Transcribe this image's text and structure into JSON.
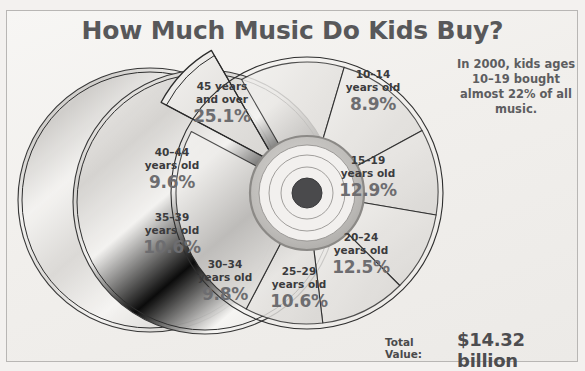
{
  "title": "How Much Music Do Kids Buy?",
  "annotation": "In 2000, kids ages 10–19 bought almost 22% of all music.",
  "total": {
    "label": "Total Value:",
    "value": "$14.32 billion"
  },
  "colors": {
    "background": "#f3f1ef",
    "frame_border": "#b8b6b4",
    "title_text": "#58585a",
    "label_text": "#3b3b3d",
    "percent_text": "#6d6d70",
    "slice_fill_light": "#f0eeec",
    "slice_fill_dark": "#d9d7d4",
    "slice_stroke": "#2b2b2b",
    "hub_dark": "#4a4a4c",
    "cd_outline": "#2e2e2e"
  },
  "chart_data": {
    "type": "pie",
    "title": "How Much Music Do Kids Buy?",
    "unit": "percent of all music purchased",
    "xlabel": "",
    "ylabel": "",
    "legend": "none (labels on slices)",
    "grid": false,
    "total_value": "$14.32 billion",
    "exploded_slice": "10–14 years old",
    "categories": [
      "10–14 years old",
      "15–19 years old",
      "20–24 years old",
      "25–29 years old",
      "30–34 years old",
      "35–39 years old",
      "40–44 years old",
      "45 years and over"
    ],
    "values": [
      8.9,
      12.9,
      12.5,
      10.6,
      9.8,
      10.6,
      9.6,
      25.1
    ],
    "slices": [
      {
        "id": "10-14",
        "name": "10–14",
        "sub": "years old",
        "percent": 8.9,
        "percent_label": "8.9%",
        "exploded": true,
        "label_x": 373,
        "label_y": 68
      },
      {
        "id": "15-19",
        "name": "15–19",
        "sub": "years old",
        "percent": 12.9,
        "percent_label": "12.9%",
        "exploded": false,
        "label_x": 368,
        "label_y": 154
      },
      {
        "id": "20-24",
        "name": "20–24",
        "sub": "years old",
        "percent": 12.5,
        "percent_label": "12.5%",
        "exploded": false,
        "label_x": 361,
        "label_y": 231
      },
      {
        "id": "25-29",
        "name": "25–29",
        "sub": "years old",
        "percent": 10.6,
        "percent_label": "10.6%",
        "exploded": false,
        "label_x": 299,
        "label_y": 265
      },
      {
        "id": "30-34",
        "name": "30–34",
        "sub": "years old",
        "percent": 9.8,
        "percent_label": "9.8%",
        "exploded": false,
        "label_x": 225,
        "label_y": 258
      },
      {
        "id": "35-39",
        "name": "35–39",
        "sub": "years old",
        "percent": 10.6,
        "percent_label": "10.6%",
        "exploded": false,
        "label_x": 172,
        "label_y": 211
      },
      {
        "id": "40-44",
        "name": "40–44",
        "sub": "years old",
        "percent": 9.6,
        "percent_label": "9.6%",
        "exploded": false,
        "label_x": 172,
        "label_y": 146
      },
      {
        "id": "45-over",
        "name": "45 years",
        "sub": "and over",
        "percent": 25.1,
        "percent_label": "25.1%",
        "exploded": false,
        "label_x": 222,
        "label_y": 80
      }
    ]
  },
  "decor": {
    "cd_discs": [
      {
        "cx": 150,
        "cy": 200,
        "r": 132
      },
      {
        "cx": 205,
        "cy": 202,
        "r": 132
      }
    ],
    "hub": {
      "cx": 307,
      "cy": 193,
      "r_hole": 15,
      "r_rings": [
        26,
        38,
        48,
        57
      ]
    }
  }
}
